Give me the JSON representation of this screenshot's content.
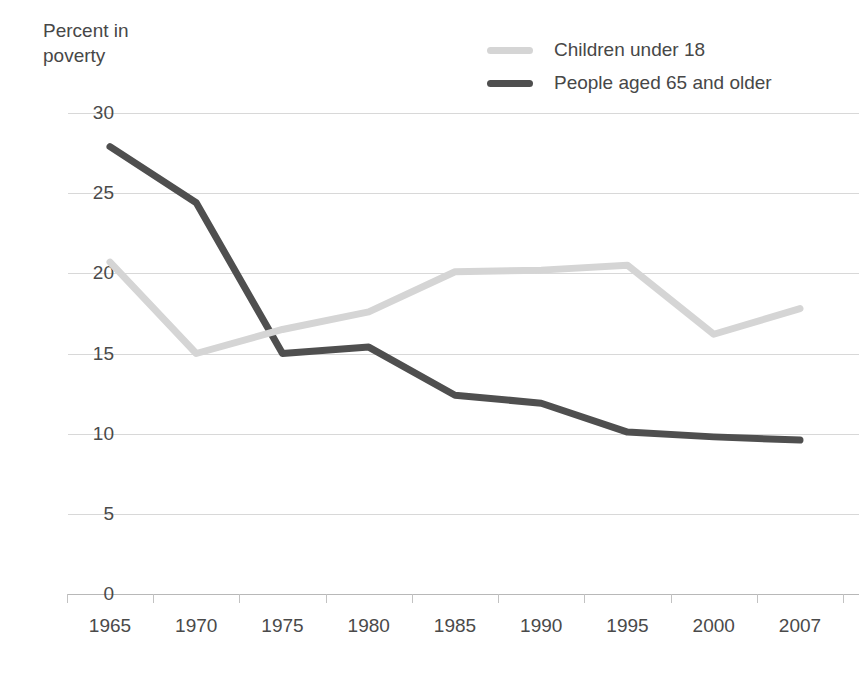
{
  "chart_data": {
    "type": "line",
    "title": "",
    "ylabel": "Percent in\npoverty",
    "xlabel": "",
    "categories": [
      "1965",
      "1970",
      "1975",
      "1980",
      "1985",
      "1990",
      "1995",
      "2000",
      "2007"
    ],
    "x": [
      1965,
      1970,
      1975,
      1980,
      1985,
      1990,
      1995,
      2000,
      2007
    ],
    "series": [
      {
        "name": "Children under 18",
        "color": "#d5d5d5",
        "values": [
          20.7,
          15.0,
          16.5,
          17.6,
          20.1,
          20.2,
          20.5,
          16.2,
          17.8
        ]
      },
      {
        "name": "People aged 65 and older",
        "color": "#4f4f4f",
        "values": [
          27.9,
          24.4,
          15.0,
          15.4,
          12.4,
          11.9,
          10.1,
          9.8,
          9.6
        ]
      }
    ],
    "yticks": [
      0,
      5,
      10,
      15,
      20,
      25,
      30
    ],
    "ytick_labels": [
      "0",
      "5",
      "10",
      "15",
      "20",
      "25",
      "30"
    ],
    "ylim": [
      0,
      30
    ],
    "grid": true,
    "legend_position": "top-right"
  },
  "legend": {
    "items": [
      {
        "label": "Children under 18",
        "color": "#d5d5d5"
      },
      {
        "label": "People aged 65 and older",
        "color": "#4f4f4f"
      }
    ]
  },
  "axis": {
    "y_title": "Percent in\npoverty"
  }
}
